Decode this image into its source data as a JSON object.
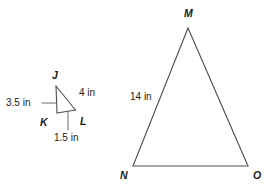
{
  "figure": {
    "stroke_color": "#4d4d4d",
    "base_stroke_color": "#8c8c8c",
    "leader_color": "#6b6b6b",
    "background": "#ffffff",
    "text_color": "#1a1a1a"
  },
  "small_triangle": {
    "name": "triangle-jkl",
    "vertices": [
      {
        "label": "J",
        "x": 56,
        "y": 86
      },
      {
        "label": "K",
        "x": 57,
        "y": 113
      },
      {
        "label": "L",
        "x": 75,
        "y": 110
      }
    ],
    "vertex_labels": {
      "j": "J",
      "k": "K",
      "l": "L"
    },
    "measures": {
      "jk": "3.5 in",
      "jl": "4 in",
      "kl": "1.5 in"
    }
  },
  "large_triangle": {
    "name": "triangle-mno",
    "vertices": [
      {
        "label": "M",
        "x": 188,
        "y": 28
      },
      {
        "label": "N",
        "x": 133,
        "y": 166
      },
      {
        "label": "O",
        "x": 248,
        "y": 166
      }
    ],
    "vertex_labels": {
      "m": "M",
      "n": "N",
      "o": "O"
    },
    "measures": {
      "mn": "14 in"
    }
  }
}
